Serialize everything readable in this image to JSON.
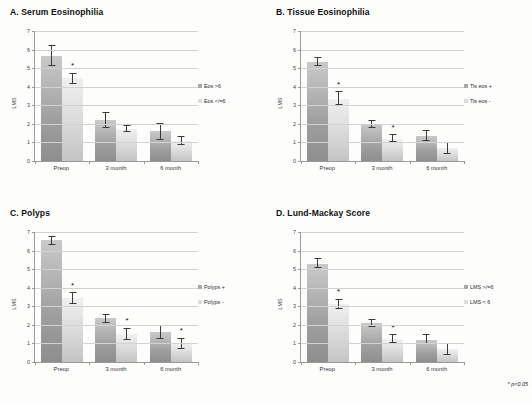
{
  "figure": {
    "footnote_marker": "*",
    "footnote_text": "p<0.05",
    "background": "#fdfdfc",
    "series_colors": [
      "#a8a8a8",
      "#dcdcdc"
    ]
  },
  "chart_data": [
    {
      "type": "bar",
      "panel": "A",
      "title": "A. Serum Eosinophilia",
      "categories": [
        "Preop",
        "3 month",
        "6 month"
      ],
      "xlabel": "",
      "ylabel": "LMS",
      "ylim": [
        0,
        7
      ],
      "yticks": [
        0,
        1,
        2,
        3,
        4,
        5,
        6,
        7
      ],
      "grid": true,
      "legend_position": "right",
      "series": [
        {
          "name": "Eos >6",
          "values": [
            5.65,
            2.2,
            1.6
          ],
          "err_low": [
            0.55,
            0.4,
            0.45
          ],
          "err_high": [
            0.6,
            0.45,
            0.45
          ],
          "significant": [
            false,
            false,
            false
          ]
        },
        {
          "name": "Eos </=6",
          "values": [
            4.45,
            1.75,
            1.1
          ],
          "err_low": [
            0.3,
            0.2,
            0.25
          ],
          "err_high": [
            0.3,
            0.2,
            0.25
          ],
          "significant": [
            true,
            false,
            false
          ]
        }
      ]
    },
    {
      "type": "bar",
      "panel": "B",
      "title": "B. Tissue Eosinophilia",
      "categories": [
        "Preop",
        "3 month",
        "6 month"
      ],
      "xlabel": "",
      "ylabel": "LMS",
      "ylim": [
        0,
        7
      ],
      "yticks": [
        0,
        1,
        2,
        3,
        4,
        5,
        6,
        7
      ],
      "grid": true,
      "legend_position": "right",
      "series": [
        {
          "name": "Tis eos +",
          "values": [
            5.35,
            2.0,
            1.35
          ],
          "err_low": [
            0.25,
            0.2,
            0.25
          ],
          "err_high": [
            0.25,
            0.2,
            0.3
          ],
          "significant": [
            false,
            false,
            false
          ]
        },
        {
          "name": "Tis eos -",
          "values": [
            3.35,
            1.2,
            0.7
          ],
          "err_low": [
            0.35,
            0.2,
            0.3
          ],
          "err_high": [
            0.4,
            0.25,
            0.35
          ],
          "significant": [
            true,
            true,
            false
          ]
        }
      ]
    },
    {
      "type": "bar",
      "panel": "C",
      "title": "C. Polyps",
      "categories": [
        "Preop",
        "3 month",
        "6 month"
      ],
      "xlabel": "",
      "ylabel": "LMS",
      "ylim": [
        0,
        7
      ],
      "yticks": [
        0,
        1,
        2,
        3,
        4,
        5,
        6,
        7
      ],
      "grid": true,
      "legend_position": "right",
      "series": [
        {
          "name": "Polyps +",
          "values": [
            6.55,
            2.35,
            1.6
          ],
          "err_low": [
            0.25,
            0.25,
            0.35
          ],
          "err_high": [
            0.25,
            0.25,
            0.4
          ],
          "significant": [
            false,
            false,
            false
          ]
        },
        {
          "name": "Polyps -",
          "values": [
            3.45,
            1.5,
            1.0
          ],
          "err_low": [
            0.3,
            0.3,
            0.3
          ],
          "err_high": [
            0.3,
            0.35,
            0.3
          ],
          "significant": [
            true,
            true,
            true
          ]
        }
      ]
    },
    {
      "type": "bar",
      "panel": "D",
      "title": "D. Lund-Mackay Score",
      "categories": [
        "Preop",
        "3 month",
        "6 month"
      ],
      "xlabel": "",
      "ylabel": "LMS",
      "ylim": [
        0,
        7
      ],
      "yticks": [
        0,
        1,
        2,
        3,
        4,
        5,
        6,
        7
      ],
      "grid": true,
      "legend_position": "right",
      "series": [
        {
          "name": "LMS >/=6",
          "values": [
            5.3,
            2.1,
            1.2
          ],
          "err_low": [
            0.25,
            0.2,
            0.25
          ],
          "err_high": [
            0.3,
            0.2,
            0.3
          ],
          "significant": [
            false,
            false,
            false
          ]
        },
        {
          "name": "LMS < 6",
          "values": [
            3.1,
            1.25,
            0.7
          ],
          "err_low": [
            0.25,
            0.25,
            0.3
          ],
          "err_high": [
            0.3,
            0.25,
            0.35
          ],
          "significant": [
            true,
            true,
            false
          ]
        }
      ]
    }
  ]
}
